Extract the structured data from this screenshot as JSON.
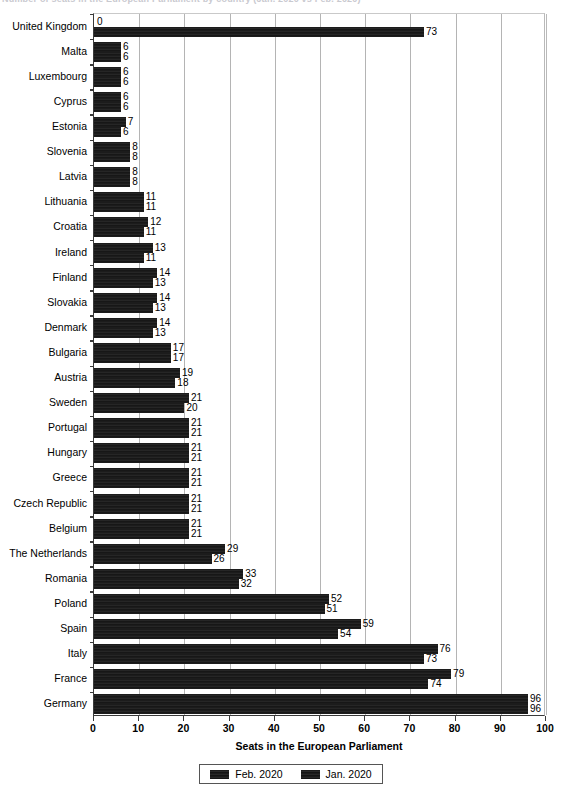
{
  "title_clipped": "Number of seats in the European Parliament by country (Jan. 2020 vs Feb. 2020)",
  "chart_data": {
    "type": "bar",
    "orientation": "horizontal",
    "title": "",
    "xlabel": "Seats in the European Parliament",
    "ylabel": "",
    "xlim": [
      0,
      100
    ],
    "xticks": [
      0,
      10,
      20,
      30,
      40,
      50,
      60,
      70,
      80,
      90,
      100
    ],
    "grid": "vertical",
    "legend_position": "bottom-center",
    "categories": [
      "United Kingdom",
      "Malta",
      "Luxembourg",
      "Cyprus",
      "Estonia",
      "Slovenia",
      "Latvia",
      "Lithuania",
      "Croatia",
      "Ireland",
      "Finland",
      "Slovakia",
      "Denmark",
      "Bulgaria",
      "Austria",
      "Sweden",
      "Portugal",
      "Hungary",
      "Greece",
      "Czech Republic",
      "Belgium",
      "The Netherlands",
      "Romania",
      "Poland",
      "Spain",
      "Italy",
      "France",
      "Germany"
    ],
    "series": [
      {
        "name": "Feb. 2020",
        "color": "#1e1e1e",
        "values": [
          0,
          6,
          6,
          6,
          7,
          8,
          8,
          11,
          12,
          13,
          14,
          14,
          14,
          17,
          19,
          21,
          21,
          21,
          21,
          21,
          21,
          29,
          33,
          52,
          59,
          76,
          79,
          96
        ]
      },
      {
        "name": "Jan. 2020",
        "color": "#1e1e1e",
        "values": [
          73,
          6,
          6,
          6,
          6,
          8,
          8,
          11,
          11,
          11,
          13,
          13,
          13,
          17,
          18,
          20,
          21,
          21,
          21,
          21,
          21,
          26,
          32,
          51,
          54,
          73,
          74,
          96
        ]
      }
    ]
  },
  "legend": {
    "items": [
      {
        "label": "Feb. 2020"
      },
      {
        "label": "Jan. 2020"
      }
    ]
  }
}
